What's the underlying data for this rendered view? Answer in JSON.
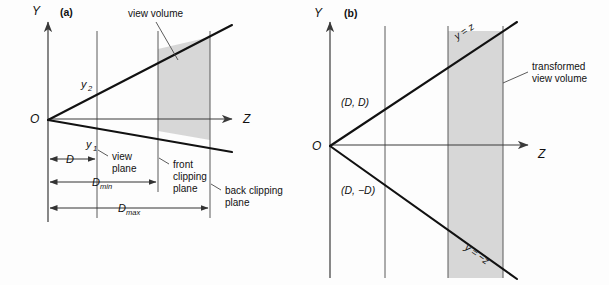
{
  "figure": {
    "panels": [
      {
        "id": "a",
        "tag": "(a)",
        "axis_y_label": "Y",
        "axis_z_label": "Z",
        "origin_label": "O",
        "ray_upper_label": "y",
        "ray_upper_sub": "2",
        "ray_lower_label": "y",
        "ray_lower_sub": "1",
        "annotations": {
          "view_volume": "view volume",
          "view_plane_line1": "view",
          "view_plane_line2": "plane",
          "front_clipping_line1": "front",
          "front_clipping_line2": "clipping",
          "front_clipping_line3": "plane",
          "back_clipping_line1": "back clipping",
          "back_clipping_line2": "plane"
        },
        "dimensions": [
          {
            "name": "d",
            "label": "D",
            "sub": ""
          },
          {
            "name": "dmin",
            "label": "D",
            "sub": "min"
          },
          {
            "name": "dmax",
            "label": "D",
            "sub": "max"
          }
        ]
      },
      {
        "id": "b",
        "tag": "(b)",
        "axis_y_label": "Y",
        "axis_z_label": "Z",
        "origin_label": "O",
        "coord_upper": "(D, D)",
        "coord_lower": "(D, −D)",
        "equation_upper": "y = z",
        "equation_lower": "y = −z",
        "annotations": {
          "transformed_line1": "transformed",
          "transformed_line2": "view volume"
        }
      }
    ],
    "colors": {
      "shade": "#d4d4d4",
      "bold_stroke": "#111111",
      "thin_stroke": "#5a5a5a",
      "background": "#fdfdfd"
    }
  }
}
